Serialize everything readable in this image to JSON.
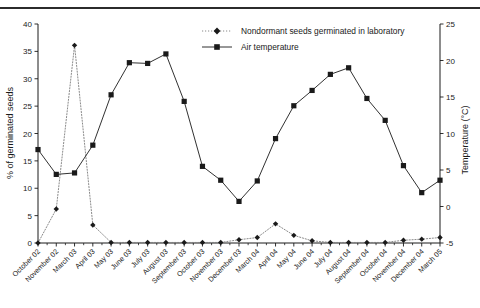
{
  "chart_data": {
    "type": "line",
    "title": "",
    "xlabel": "",
    "ylabel": "% of germinated seeds",
    "y2label": "Temperature (°C)",
    "ylim": [
      0,
      40
    ],
    "y2lim": [
      -5,
      25
    ],
    "yticks": [
      "0",
      "5",
      "10",
      "15",
      "20",
      "25",
      "30",
      "35",
      "40"
    ],
    "y2ticks": [
      "-5",
      "0",
      "5",
      "10",
      "15",
      "20",
      "25"
    ],
    "grid": false,
    "legend_position": "top-center",
    "categories": [
      "October 02",
      "November 02",
      "March 03",
      "April 03",
      "May 03",
      "June 03",
      "July 03",
      "August 03",
      "September 03",
      "October 03",
      "November 03",
      "December 03",
      "March 04",
      "April 04",
      "May 04",
      "June 04",
      "July 04",
      "August 04",
      "September 04",
      "October 04",
      "November 04",
      "December 04",
      "March 05"
    ],
    "series": [
      {
        "name": "Nondormant seeds germinated in laboratory",
        "axis": "left",
        "unit": "%",
        "marker": "diamond",
        "linestyle": "dotted",
        "color": "#7d7d7d",
        "values": [
          0,
          6.2,
          36.1,
          3.3,
          0.1,
          0.1,
          0.1,
          0.1,
          0.1,
          0.1,
          0.1,
          0.6,
          1.0,
          3.5,
          1.4,
          0.4,
          0.1,
          0.1,
          0.1,
          0.1,
          0.5,
          0.7,
          1.0
        ]
      },
      {
        "name": "Air temperature",
        "axis": "right",
        "unit": "°C",
        "marker": "square",
        "linestyle": "solid",
        "color": "#1a1a1a",
        "values": [
          7.8,
          4.4,
          4.6,
          8.4,
          15.3,
          19.7,
          19.6,
          20.9,
          14.4,
          5.5,
          3.6,
          0.7,
          3.5,
          9.3,
          13.8,
          15.9,
          18.1,
          19.0,
          14.8,
          11.8,
          5.6,
          1.9,
          3.6
        ]
      }
    ],
    "legend": [
      "Nondormant seeds germinated in laboratory",
      "Air temperature"
    ]
  }
}
